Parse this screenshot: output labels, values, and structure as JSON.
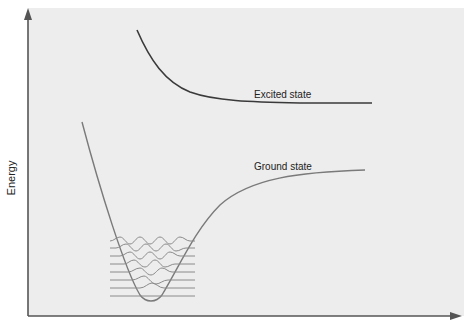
{
  "diagram": {
    "background": "#ededed",
    "axes": {
      "ylabel": "Energy",
      "xlabel": "",
      "color": "#555555"
    },
    "curves": [
      {
        "name": "Excited state",
        "color": "#3a3a3a"
      },
      {
        "name": "Ground state",
        "color": "#7a7a7a"
      }
    ],
    "vibrational_levels": {
      "count": 8,
      "color": "#8a8a8a",
      "description": "Vibrational energy levels with wavefunctions drawn inside the ground-state well"
    }
  }
}
